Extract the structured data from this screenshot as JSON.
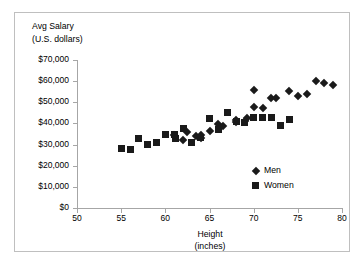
{
  "chart_data": {
    "type": "scatter",
    "title": "",
    "xlabel": "Height (inches)",
    "ylabel": "Avg Salary (U.S. dollars)",
    "xlim": [
      50,
      80
    ],
    "ylim": [
      0,
      70000
    ],
    "xticks": [
      50,
      55,
      60,
      65,
      70,
      75,
      80
    ],
    "xtick_labels": [
      "50",
      "55",
      "60",
      "65",
      "70",
      "75",
      "80"
    ],
    "yticks": [
      0,
      10000,
      20000,
      30000,
      40000,
      50000,
      60000,
      70000
    ],
    "ytick_labels": [
      "$0",
      "$10,000",
      "$20,000",
      "$30,000",
      "$40,000",
      "$50,000",
      "$60,000",
      "$70,000"
    ],
    "grid": false,
    "legend_position": "inside-lower-right",
    "series": [
      {
        "name": "Men",
        "marker": "diamond",
        "color": "#1a1a1a",
        "points": [
          [
            61.0,
            34500
          ],
          [
            62.0,
            32000
          ],
          [
            62.5,
            36000
          ],
          [
            63.5,
            34000
          ],
          [
            64.0,
            33000
          ],
          [
            64.0,
            34500
          ],
          [
            65.0,
            36500
          ],
          [
            66.0,
            39500
          ],
          [
            66.5,
            39000
          ],
          [
            68.0,
            41500
          ],
          [
            68.0,
            40500
          ],
          [
            69.0,
            41000
          ],
          [
            69.3,
            42500
          ],
          [
            70.0,
            48000
          ],
          [
            70.0,
            56000
          ],
          [
            71.0,
            47500
          ],
          [
            72.0,
            52000
          ],
          [
            72.5,
            52000
          ],
          [
            74.0,
            55500
          ],
          [
            75.0,
            52800
          ],
          [
            76.0,
            53800
          ],
          [
            77.0,
            60000
          ],
          [
            78.0,
            59300
          ],
          [
            79.0,
            58300
          ]
        ]
      },
      {
        "name": "Women",
        "marker": "square",
        "color": "#1a1a1a",
        "points": [
          [
            55.0,
            28200
          ],
          [
            56.0,
            27800
          ],
          [
            57.0,
            32800
          ],
          [
            58.0,
            30200
          ],
          [
            59.0,
            31000
          ],
          [
            60.0,
            34800
          ],
          [
            61.0,
            34800
          ],
          [
            61.2,
            33000
          ],
          [
            62.0,
            37500
          ],
          [
            63.0,
            31000
          ],
          [
            64.0,
            33500
          ],
          [
            65.0,
            42200
          ],
          [
            66.0,
            37000
          ],
          [
            67.0,
            45000
          ],
          [
            68.0,
            41000
          ],
          [
            69.0,
            40500
          ],
          [
            70.0,
            43000
          ],
          [
            71.0,
            43000
          ],
          [
            72.0,
            42700
          ],
          [
            73.0,
            39200
          ],
          [
            74.0,
            42000
          ]
        ]
      }
    ]
  },
  "legend": {
    "entries": [
      {
        "label": "Men",
        "marker": "diamond"
      },
      {
        "label": "Women",
        "marker": "square"
      }
    ]
  },
  "axes": {
    "y_title_line1": "Avg Salary",
    "y_title_line2": "(U.S. dollars)",
    "x_title_line1": "Height",
    "x_title_line2": "(inches)"
  }
}
